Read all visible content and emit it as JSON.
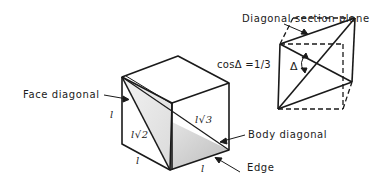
{
  "diagram": {
    "labels": {
      "diagonal_section_plane": "Diagonal section plane",
      "cos_delta": "cosΔ =1/3",
      "delta_symbol": "Δ",
      "face_diagonal": "Face diagonal",
      "body_diagonal": "Body diagonal",
      "edge": "Edge",
      "edge_length_left": "l",
      "edge_length_bottom_left": "l",
      "edge_length_bottom_right": "l",
      "face_diagonal_length": "l√2",
      "body_diagonal_length": "l√3"
    },
    "colors": {
      "line": "#1a1a1a",
      "shade": "#c8c8c8",
      "background": "#ffffff"
    }
  }
}
